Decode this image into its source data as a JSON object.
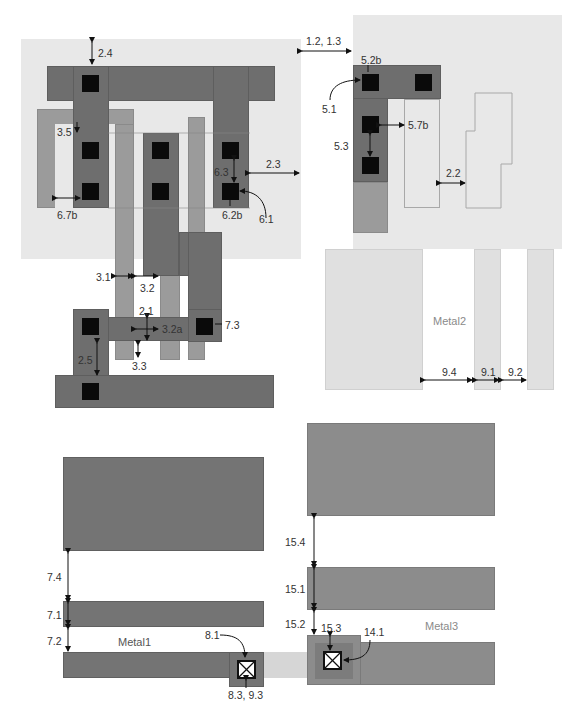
{
  "diagram": {
    "layers": {
      "metal1": "Metal1",
      "metal2": "Metal2",
      "metal3": "Metal3"
    },
    "rules_top_left": {
      "r2_4": "2.4",
      "r3_5": "3.5",
      "r6_7b": "6.7b",
      "r6_3": "6.3",
      "r6_2b": "6.2b",
      "r6_1": "6.1",
      "r2_3": "2.3",
      "r1_2_1_3": "1.2, 1.3"
    },
    "rules_top_right": {
      "r5_2b": "5.2b",
      "r5_1": "5.1",
      "r5_7b": "5.7b",
      "r5_3": "5.3",
      "r2_2": "2.2"
    },
    "rules_middle_left": {
      "r3_1": "3.1",
      "r3_2": "3.2",
      "r2_1": "2.1",
      "r3_2a": "3.2a",
      "r7_3": "7.3",
      "r2_5": "2.5",
      "r3_3": "3.3"
    },
    "rules_metal2": {
      "r9_4": "9.4",
      "r9_1": "9.1",
      "r9_2": "9.2"
    },
    "rules_metal1": {
      "r7_4": "7.4",
      "r7_1": "7.1",
      "r7_2": "7.2",
      "r8_1": "8.1",
      "r8_3_9_3": "8.3, 9.3"
    },
    "rules_metal3": {
      "r15_4": "15.4",
      "r15_1": "15.1",
      "r15_2": "15.2",
      "r15_3": "15.3",
      "r14_1": "14.1"
    },
    "colors": {
      "well": "#e8e8e8",
      "metal1": "#6e6e6e",
      "poly": "#9b9b9b",
      "contact": "#0a0a0a",
      "metal2": "#e0e0e0",
      "metal3": "#8c8c8c"
    }
  }
}
